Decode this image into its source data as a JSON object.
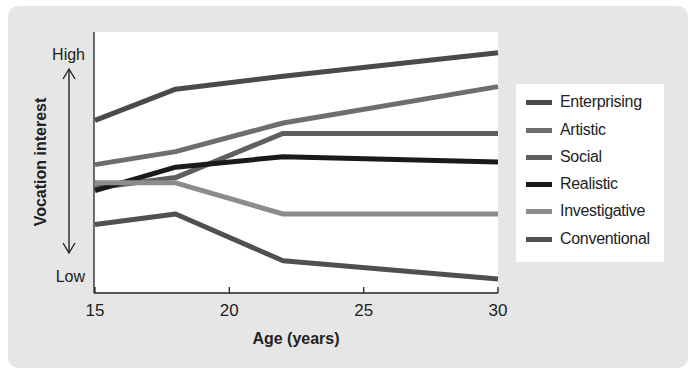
{
  "chart_data": {
    "type": "line",
    "title": "",
    "xlabel": "Age (years)",
    "ylabel": "Vocation interest",
    "y_high_label": "High",
    "y_low_label": "Low",
    "x_ticks": [
      "15",
      "20",
      "25",
      "30"
    ],
    "xlim": [
      15,
      30
    ],
    "ylim": [
      0,
      100
    ],
    "grid": false,
    "legend_position": "right",
    "x": [
      15,
      18,
      22,
      30
    ],
    "series": [
      {
        "name": "Enterprising",
        "color": "#4a4a4a",
        "values": [
          66,
          78,
          83,
          92
        ]
      },
      {
        "name": "Artistic",
        "color": "#6e6e6e",
        "values": [
          49,
          54,
          65,
          79
        ]
      },
      {
        "name": "Social",
        "color": "#5f5f5f",
        "values": [
          40,
          44,
          61,
          61
        ]
      },
      {
        "name": "Realistic",
        "color": "#1a1a1a",
        "values": [
          39,
          48,
          52,
          50
        ]
      },
      {
        "name": "Investigative",
        "color": "#8c8c8c",
        "values": [
          42,
          42,
          30,
          30
        ]
      },
      {
        "name": "Conventional",
        "color": "#505050",
        "values": [
          26,
          30,
          12,
          5
        ]
      }
    ]
  },
  "axis": {
    "y_title": "Vocation interest",
    "high": "High",
    "low": "Low",
    "x_title": "Age (years)",
    "ticks": [
      "15",
      "20",
      "25",
      "30"
    ]
  },
  "legend": [
    {
      "label": "Enterprising",
      "color": "#4a4a4a"
    },
    {
      "label": "Artistic",
      "color": "#6e6e6e"
    },
    {
      "label": "Social",
      "color": "#5f5f5f"
    },
    {
      "label": "Realistic",
      "color": "#1a1a1a"
    },
    {
      "label": "Investigative",
      "color": "#8c8c8c"
    },
    {
      "label": "Conventional",
      "color": "#505050"
    }
  ]
}
